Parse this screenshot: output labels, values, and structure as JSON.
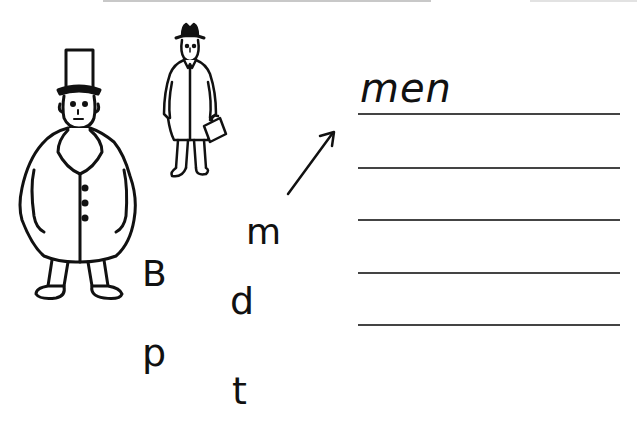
{
  "worksheet": {
    "example_word": "men",
    "letters": [
      {
        "char": "m",
        "x": 246,
        "y": 216
      },
      {
        "char": "B",
        "x": 142,
        "y": 256
      },
      {
        "char": "d",
        "x": 232,
        "y": 284
      },
      {
        "char": "p",
        "x": 142,
        "y": 334
      },
      {
        "char": "t",
        "x": 230,
        "y": 372
      }
    ],
    "writing_lines": 5,
    "illustrations": [
      "man-in-top-hat-and-overcoat",
      "man-with-hat-and-briefcase"
    ],
    "arrow": "arrow-pointing-to-answer-line"
  },
  "colors": {
    "ink": "#111111",
    "line": "#444444",
    "background": "#ffffff"
  }
}
